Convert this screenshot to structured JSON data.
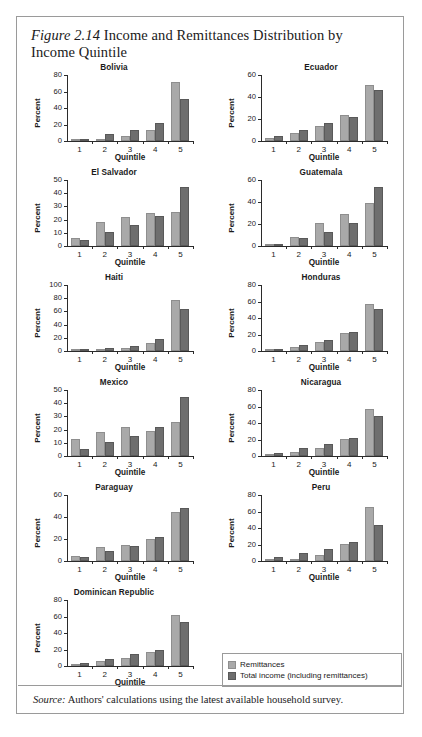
{
  "figure": {
    "number_label": "Figure 2.14",
    "title": "Income and Remittances Distribution by Income Quintile",
    "source_lead": "Source:",
    "source_text": "Authors' calculations using the latest available household survey."
  },
  "legend": {
    "items": [
      {
        "label": "Remittances",
        "color": "#a9a9a9"
      },
      {
        "label": "Total income (including remittances)",
        "color": "#6e6e6e"
      }
    ]
  },
  "axis_titles": {
    "y": "Percent",
    "x": "Quintile"
  },
  "chart_data": [
    {
      "type": "bar",
      "title": "Bolivia",
      "xlabel": "Quintile",
      "ylabel": "Percent",
      "categories": [
        "1",
        "2",
        "3",
        "4",
        "5"
      ],
      "ylim": [
        0,
        80
      ],
      "yticks": [
        0,
        20,
        40,
        60,
        80
      ],
      "grid": false,
      "legend_position": "figure-bottom-right",
      "series": [
        {
          "name": "Remittances",
          "values": [
            1.5,
            3,
            6,
            13,
            72
          ]
        },
        {
          "name": "Total income (including remittances)",
          "values": [
            2.5,
            8,
            13.5,
            21.5,
            51
          ]
        }
      ]
    },
    {
      "type": "bar",
      "title": "Ecuador",
      "xlabel": "Quintile",
      "ylabel": "Percent",
      "categories": [
        "1",
        "2",
        "3",
        "4",
        "5"
      ],
      "ylim": [
        0,
        60
      ],
      "yticks": [
        0,
        20,
        40,
        60
      ],
      "grid": false,
      "series": [
        {
          "name": "Remittances",
          "values": [
            3,
            7,
            13.5,
            24,
            51
          ]
        },
        {
          "name": "Total income (including remittances)",
          "values": [
            5,
            10,
            16,
            21.5,
            46
          ]
        }
      ]
    },
    {
      "type": "bar",
      "title": "El Salvador",
      "xlabel": "Quintile",
      "ylabel": "Percent",
      "categories": [
        "1",
        "2",
        "3",
        "4",
        "5"
      ],
      "ylim": [
        0,
        50
      ],
      "yticks": [
        0,
        10,
        20,
        30,
        40,
        50
      ],
      "grid": false,
      "series": [
        {
          "name": "Remittances",
          "values": [
            6,
            18,
            22,
            25,
            26
          ]
        },
        {
          "name": "Total income (including remittances)",
          "values": [
            4.5,
            10.5,
            16,
            22.5,
            45
          ]
        }
      ]
    },
    {
      "type": "bar",
      "title": "Guatemala",
      "xlabel": "Quintile",
      "ylabel": "Percent",
      "categories": [
        "1",
        "2",
        "3",
        "4",
        "5"
      ],
      "ylim": [
        0,
        60
      ],
      "yticks": [
        0,
        20,
        40,
        60
      ],
      "grid": false,
      "series": [
        {
          "name": "Remittances",
          "values": [
            2,
            8,
            20.5,
            29,
            39
          ]
        },
        {
          "name": "Total income (including remittances)",
          "values": [
            2,
            7.5,
            13,
            21,
            54
          ]
        }
      ]
    },
    {
      "type": "bar",
      "title": "Haiti",
      "xlabel": "Quintile",
      "ylabel": "Percent",
      "categories": [
        "1",
        "2",
        "3",
        "4",
        "5"
      ],
      "ylim": [
        0,
        100
      ],
      "yticks": [
        0,
        20,
        40,
        60,
        80,
        100
      ],
      "grid": false,
      "series": [
        {
          "name": "Remittances",
          "values": [
            1,
            2,
            5,
            12,
            77
          ]
        },
        {
          "name": "Total income (including remittances)",
          "values": [
            1.5,
            4,
            8,
            18,
            64
          ]
        }
      ]
    },
    {
      "type": "bar",
      "title": "Honduras",
      "xlabel": "Quintile",
      "ylabel": "Percent",
      "categories": [
        "1",
        "2",
        "3",
        "4",
        "5"
      ],
      "ylim": [
        0,
        80
      ],
      "yticks": [
        0,
        20,
        40,
        60,
        80
      ],
      "grid": false,
      "series": [
        {
          "name": "Remittances",
          "values": [
            1,
            4.5,
            11.5,
            22,
            57
          ]
        },
        {
          "name": "Total income (including remittances)",
          "values": [
            2.5,
            7,
            13,
            22.5,
            51
          ]
        }
      ]
    },
    {
      "type": "bar",
      "title": "Mexico",
      "xlabel": "Quintile",
      "ylabel": "Percent",
      "categories": [
        "1",
        "2",
        "3",
        "4",
        "5"
      ],
      "ylim": [
        0,
        50
      ],
      "yticks": [
        0,
        10,
        20,
        30,
        40,
        50
      ],
      "grid": false,
      "series": [
        {
          "name": "Remittances",
          "values": [
            13,
            18,
            22,
            19,
            25.5
          ]
        },
        {
          "name": "Total income (including remittances)",
          "values": [
            5.5,
            10.5,
            15,
            22,
            44.5
          ]
        }
      ]
    },
    {
      "type": "bar",
      "title": "Nicaragua",
      "xlabel": "Quintile",
      "ylabel": "Percent",
      "categories": [
        "1",
        "2",
        "3",
        "4",
        "5"
      ],
      "ylim": [
        0,
        80
      ],
      "yticks": [
        0,
        20,
        40,
        60,
        80
      ],
      "grid": false,
      "series": [
        {
          "name": "Remittances",
          "values": [
            2,
            5,
            10,
            21,
            57
          ]
        },
        {
          "name": "Total income (including remittances)",
          "values": [
            4,
            9.5,
            14,
            22,
            48
          ]
        }
      ]
    },
    {
      "type": "bar",
      "title": "Paraguay",
      "xlabel": "Quintile",
      "ylabel": "Percent",
      "categories": [
        "1",
        "2",
        "3",
        "4",
        "5"
      ],
      "ylim": [
        0,
        60
      ],
      "yticks": [
        0,
        20,
        40,
        60
      ],
      "grid": false,
      "series": [
        {
          "name": "Remittances",
          "values": [
            4.5,
            13,
            15,
            20,
            44.5
          ]
        },
        {
          "name": "Total income (including remittances)",
          "values": [
            4,
            9.5,
            14,
            21.5,
            48
          ]
        }
      ]
    },
    {
      "type": "bar",
      "title": "Peru",
      "xlabel": "Quintile",
      "ylabel": "Percent",
      "categories": [
        "1",
        "2",
        "3",
        "4",
        "5"
      ],
      "ylim": [
        0,
        80
      ],
      "yticks": [
        0,
        20,
        40,
        60,
        80
      ],
      "grid": false,
      "series": [
        {
          "name": "Remittances",
          "values": [
            0.5,
            3,
            7,
            21,
            65
          ]
        },
        {
          "name": "Total income (including remittances)",
          "values": [
            4.5,
            9.5,
            15,
            22.5,
            44
          ]
        }
      ]
    },
    {
      "type": "bar",
      "title": "Dominican Republic",
      "xlabel": "Quintile",
      "ylabel": "Percent",
      "categories": [
        "1",
        "2",
        "3",
        "4",
        "5"
      ],
      "ylim": [
        0,
        80
      ],
      "yticks": [
        0,
        20,
        40,
        60,
        80
      ],
      "grid": false,
      "series": [
        {
          "name": "Remittances",
          "values": [
            2,
            5.5,
            10,
            17,
            62
          ]
        },
        {
          "name": "Total income (including remittances)",
          "values": [
            4,
            8.5,
            14,
            20,
            53
          ]
        }
      ]
    }
  ]
}
